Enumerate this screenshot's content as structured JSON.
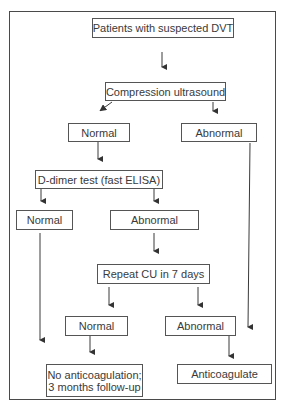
{
  "diagram": {
    "type": "flowchart",
    "nodes": {
      "start": {
        "label": "Patients with suspected DVT"
      },
      "cu": {
        "label": "Compression ultrasound"
      },
      "cu_normal": {
        "label": "Normal"
      },
      "cu_abnormal": {
        "label": "Abnormal"
      },
      "ddimer": {
        "label": "D-dimer test (fast ELISA)"
      },
      "dd_normal": {
        "label": "Normal"
      },
      "dd_abnormal": {
        "label": "Abnormal"
      },
      "repeat_cu": {
        "label": "Repeat CU in 7 days"
      },
      "rcu_normal": {
        "label": "Normal"
      },
      "rcu_abnormal": {
        "label": "Abnormal"
      },
      "no_anticoag_line1": {
        "label": "No anticoagulation;"
      },
      "no_anticoag_line2": {
        "label": "3 months follow-up"
      },
      "anticoagulate": {
        "label": "Anticoagulate"
      }
    },
    "edges": [
      {
        "from": "start",
        "to": "cu"
      },
      {
        "from": "cu",
        "to": "cu_normal"
      },
      {
        "from": "cu",
        "to": "cu_abnormal"
      },
      {
        "from": "cu_normal",
        "to": "ddimer"
      },
      {
        "from": "ddimer",
        "to": "dd_normal"
      },
      {
        "from": "ddimer",
        "to": "dd_abnormal"
      },
      {
        "from": "dd_abnormal",
        "to": "repeat_cu"
      },
      {
        "from": "repeat_cu",
        "to": "rcu_normal"
      },
      {
        "from": "repeat_cu",
        "to": "rcu_abnormal"
      },
      {
        "from": "dd_normal",
        "to": "no_anticoag"
      },
      {
        "from": "rcu_normal",
        "to": "no_anticoag"
      },
      {
        "from": "rcu_abnormal",
        "to": "anticoagulate"
      },
      {
        "from": "cu_abnormal",
        "to": "anticoagulate"
      }
    ],
    "colors": {
      "line": "#3a3a3a",
      "text": "#3a3a3a",
      "background": "#ffffff"
    }
  }
}
